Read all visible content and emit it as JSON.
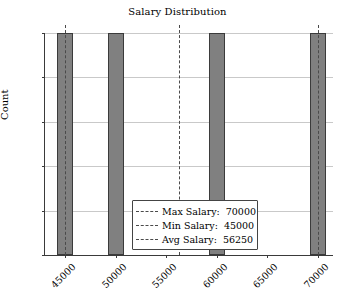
{
  "chart_data": {
    "type": "bar",
    "title": "Salary Distribution",
    "xlabel": "",
    "ylabel": "Count",
    "categories": [
      "45000",
      "50000",
      "60000",
      "70000"
    ],
    "values": [
      1.0,
      1.0,
      1.0,
      1.0
    ],
    "x": [
      45000,
      50000,
      60000,
      70000
    ],
    "xlim": [
      43000,
      71500
    ],
    "ylim": [
      0.0,
      1.0
    ],
    "xticks": [
      "45000",
      "50000",
      "55000",
      "60000",
      "65000",
      "70000"
    ],
    "xtick_values": [
      45000,
      50000,
      55000,
      60000,
      65000,
      70000
    ],
    "yticks": [
      "0.0",
      "0.2",
      "0.4",
      "0.6",
      "0.8",
      "1.0"
    ],
    "ytick_values": [
      0.0,
      0.2,
      0.4,
      0.6,
      0.8,
      1.0
    ],
    "grid": "horizontal",
    "legend_position": "lower center",
    "bar_color": "#808080",
    "bar_edge_color": "#3b3b3b",
    "gridline_color": "#c9c9c9",
    "refline_color": "#4a4a4a",
    "annotations": [
      {
        "name": "Max Salary",
        "label": "Max Salary:",
        "value": "70000",
        "at": 70000
      },
      {
        "name": "Min Salary",
        "label": "Min Salary:",
        "value": "45000",
        "at": 45000
      },
      {
        "name": "Avg Salary",
        "label": "Avg Salary:",
        "value": "56250",
        "at": 56250
      }
    ]
  },
  "legend": {
    "rows": [
      {
        "label": "Max Salary:",
        "value": "70000"
      },
      {
        "label": "Min Salary:",
        "value": "45000"
      },
      {
        "label": "Avg Salary:",
        "value": "56250"
      }
    ]
  },
  "axes": {
    "y_label": "Count",
    "y_ticks": [
      "1.0",
      "0.8",
      "0.6",
      "0.4",
      "0.2",
      "0.0"
    ],
    "x_ticks": [
      "45000",
      "50000",
      "55000",
      "60000",
      "65000",
      "70000"
    ]
  }
}
